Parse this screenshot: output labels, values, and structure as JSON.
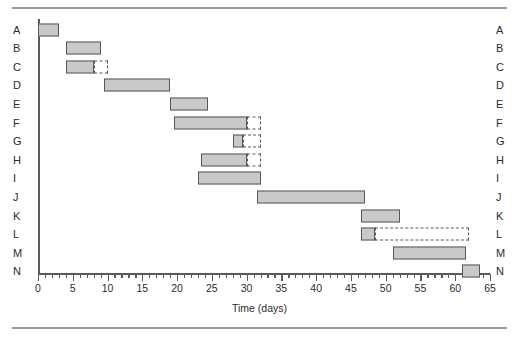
{
  "figure": {
    "title": "",
    "xlabel": "Time (days)"
  },
  "chart_data": {
    "type": "bar",
    "chart_subtype": "gantt",
    "title": "",
    "xlabel": "Time (days)",
    "ylabel": "",
    "xlim": [
      0,
      65
    ],
    "ylim_categories": [
      "A",
      "B",
      "C",
      "D",
      "E",
      "F",
      "G",
      "H",
      "I",
      "J",
      "K",
      "L",
      "M",
      "N"
    ],
    "x_major_ticks": [
      0,
      5,
      10,
      15,
      20,
      25,
      30,
      35,
      40,
      45,
      50,
      55,
      60,
      65
    ],
    "x_minor_tick_interval": 1,
    "grid": false,
    "legend": null,
    "axis_side_labels": "both",
    "categories": [
      "A",
      "B",
      "C",
      "D",
      "E",
      "F",
      "G",
      "H",
      "I",
      "J",
      "K",
      "L",
      "M",
      "N"
    ],
    "tasks": [
      {
        "label": "A",
        "start": 0,
        "end": 3,
        "duration": 3,
        "slack_end": null,
        "slack": 0
      },
      {
        "label": "B",
        "start": 4,
        "end": 9,
        "duration": 5,
        "slack_end": null,
        "slack": 0
      },
      {
        "label": "C",
        "start": 4,
        "end": 8,
        "duration": 4,
        "slack_end": 10,
        "slack": 2
      },
      {
        "label": "D",
        "start": 9.5,
        "end": 19,
        "duration": 9.5,
        "slack_end": null,
        "slack": 0
      },
      {
        "label": "E",
        "start": 19,
        "end": 24.5,
        "duration": 5.5,
        "slack_end": null,
        "slack": 0
      },
      {
        "label": "F",
        "start": 19.5,
        "end": 30,
        "duration": 10.5,
        "slack_end": 32,
        "slack": 2
      },
      {
        "label": "G",
        "start": 28,
        "end": 29.5,
        "duration": 1.5,
        "slack_end": 32,
        "slack": 2.5
      },
      {
        "label": "H",
        "start": 23.5,
        "end": 30,
        "duration": 6.5,
        "slack_end": 32,
        "slack": 2
      },
      {
        "label": "I",
        "start": 23,
        "end": 32,
        "duration": 9,
        "slack_end": null,
        "slack": 0
      },
      {
        "label": "J",
        "start": 31.5,
        "end": 47,
        "duration": 15.5,
        "slack_end": null,
        "slack": 0
      },
      {
        "label": "K",
        "start": 46.5,
        "end": 52,
        "duration": 5.5,
        "slack_end": null,
        "slack": 0
      },
      {
        "label": "L",
        "start": 46.5,
        "end": 48.5,
        "duration": 2,
        "slack_end": 62,
        "slack": 13.5
      },
      {
        "label": "M",
        "start": 51,
        "end": 61.5,
        "duration": 10.5,
        "slack_end": null,
        "slack": 0
      },
      {
        "label": "N",
        "start": 61,
        "end": 63.5,
        "duration": 2.5,
        "slack_end": null,
        "slack": 0
      }
    ],
    "bar_fill_color": "#c9c9c9",
    "bar_border_color": "#585858",
    "slack_style": "dashed"
  }
}
